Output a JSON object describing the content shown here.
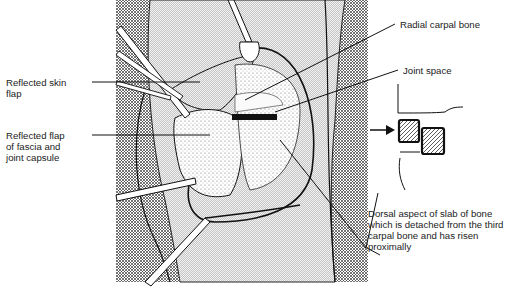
{
  "figure": {
    "type": "surgical illustration",
    "colors": {
      "ink": "#1a1a1a",
      "background": "#ffffff",
      "hatch": "#6b6b6b"
    }
  },
  "labels": {
    "reflected_skin_flap": "Reflected skin\nflap",
    "reflected_fascia_flap": "Reflected flap\nof fascia and\njoint capsule",
    "radial_carpal_bone": "Radial carpal bone",
    "joint_space": "Joint space",
    "dorsal_slab": "Dorsal aspect of slab of bone\nwhich is detached from the third\ncarpal bone and has risen\nproximally"
  },
  "inset": {
    "description": "Lateral schematic of carpal bones with slab displaced",
    "arrow": "right-arrow"
  }
}
